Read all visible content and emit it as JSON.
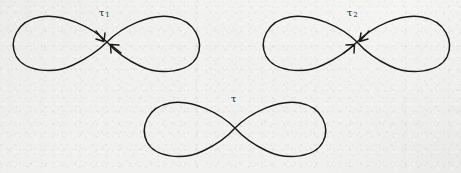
{
  "figure": {
    "background_color": "#f1f1f0",
    "stroke_color": "#1b1b1b",
    "curves": [
      {
        "id": "tau-1",
        "label_tau": "τ",
        "label_subscript": "1",
        "has_arrows": true,
        "arrow_directions": [
          "from-upper-left",
          "from-lower-right"
        ],
        "crossing_x": 107,
        "crossing_y": 42
      },
      {
        "id": "tau-2",
        "label_tau": "τ",
        "label_subscript": "2",
        "has_arrows": true,
        "arrow_directions": [
          "from-upper-right",
          "from-lower-left"
        ],
        "crossing_x": 357,
        "crossing_y": 42
      },
      {
        "id": "tau",
        "label_tau": "τ",
        "label_subscript": "",
        "has_arrows": false,
        "arrow_directions": [],
        "crossing_x": 235,
        "crossing_y": 128
      }
    ]
  }
}
